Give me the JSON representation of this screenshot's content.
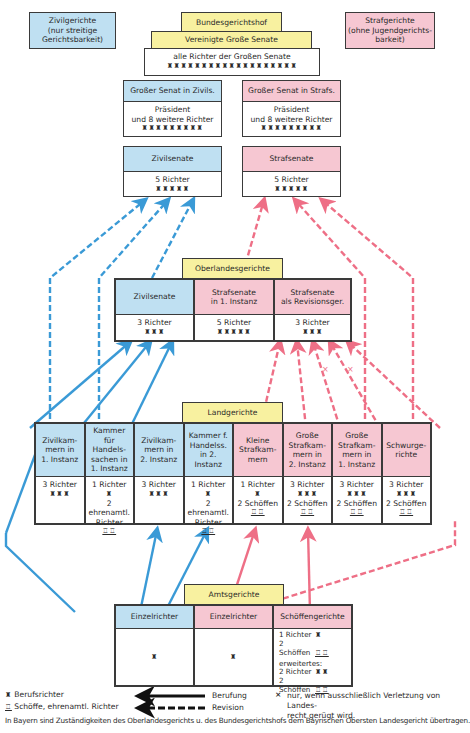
{
  "legend_boxes": {
    "civil": "Zivilgerichte\n(nur streitige\nGerichtsbarkeit)",
    "criminal": "Strafgerichte\n(ohne Jugendgerichts-\nbarkeit)"
  },
  "bgh": {
    "title": "Bundesgerichtshof",
    "united": "Vereinigte Große Senate",
    "all_judges_label": "alle Richter der Großen Senate",
    "all_judges_icons": "♜♜♜♜♜♜♜♜♜♜♜♜♜♜♜♜♜♜♜",
    "grand_civil": {
      "title": "Großer Senat in Zivils.",
      "line1": "Präsident",
      "line2": "und 8 weitere Richter",
      "icons": "♜♜♜♜♜♜♜♜♜"
    },
    "grand_criminal": {
      "title": "Großer Senat in Strafs.",
      "line1": "Präsident",
      "line2": "und 8 weitere Richter",
      "icons": "♜♜♜♜♜♜♜♜♜"
    },
    "civil_senates": {
      "title": "Zivilsenate",
      "judges": "5 Richter",
      "icons": "♜♜♜♜♜"
    },
    "criminal_senates": {
      "title": "Strafsenate",
      "judges": "5 Richter",
      "icons": "♜♜♜♜♜"
    }
  },
  "olg": {
    "title": "Oberlandesgerichte",
    "cells": [
      {
        "title": "Zivilsenate",
        "judges": "3 Richter",
        "icons": "♜♜♜"
      },
      {
        "title": "Strafsenate\nin 1. Instanz",
        "judges": "5 Richter",
        "icons": "♜♜♜♜♜"
      },
      {
        "title": "Strafsenate\nals Revisionsger.",
        "judges": "3 Richter",
        "icons": "♜♜♜"
      }
    ]
  },
  "lg": {
    "title": "Landgerichte",
    "cells": [
      {
        "title": "Zivilkam-\nmern in\n1. Instanz",
        "judges": "3 Richter",
        "icons": "♜♜♜",
        "lay": "",
        "lay_icons": ""
      },
      {
        "title": "Kammer\nfür Handels-\nsachen in\n1. Instanz",
        "judges": "1 Richter",
        "icons": "♜",
        "lay": "2 ehrenamtl.\nRichter",
        "lay_icons": "♖♖"
      },
      {
        "title": "Zivilkam-\nmern in\n2. Instanz",
        "judges": "3 Richter",
        "icons": "♜♜♜",
        "lay": "",
        "lay_icons": ""
      },
      {
        "title": "Kammer f.\nHandelss.\nin 2. Instanz",
        "judges": "1 Richter",
        "icons": "♜",
        "lay": "2 ehrenamtl.\nRichter",
        "lay_icons": "♖♖"
      },
      {
        "title": "Kleine\nStrafkam-\nmern",
        "judges": "1 Richter",
        "icons": "♜",
        "lay": "2 Schöffen",
        "lay_icons": "♖♖"
      },
      {
        "title": "Große\nStrafkam-\nmern in\n2. Instanz",
        "judges": "3 Richter",
        "icons": "♜♜♜",
        "lay": "2 Schöffen",
        "lay_icons": "♖♖"
      },
      {
        "title": "Große\nStrafkam-\nmern in\n1. Instanz",
        "judges": "3 Richter",
        "icons": "♜♜♜",
        "lay": "2 Schöffen",
        "lay_icons": "♖♖"
      },
      {
        "title": "Schwurge-\nrichte",
        "judges": "3 Richter",
        "icons": "♜♜♜",
        "lay": "2 Schöffen",
        "lay_icons": "♖♖"
      }
    ]
  },
  "ag": {
    "title": "Amtsgerichte",
    "cells": [
      {
        "title": "Einzelrichter",
        "icons": "♜"
      },
      {
        "title": "Einzelrichter",
        "icons": "♜"
      },
      {
        "title": "Schöffengerichte",
        "l1": "1 Richter",
        "l1_icons": "♜",
        "l2": "2 Schöffen",
        "l2_icons": "♖♖",
        "ext": "erweitertes:",
        "l3": "2 Richter",
        "l3_icons": "♜♜",
        "l4": "2 Schöffen",
        "l4_icons": "♖♖"
      }
    ]
  },
  "legend": {
    "professional_icon": "♜",
    "professional": "Berufsrichter",
    "lay_icon": "♖",
    "lay": "Schöffe, ehrenamtl. Richter",
    "appeal": "Berufung",
    "revision": "Revision",
    "x_mark": "×",
    "x_note": "nur, wenn ausschließlich Verletzung von Landes-\nrecht gerügt wird."
  },
  "footer": "In Bayern sind Zuständigkeiten des Oberlandesgerichts u. des Bundesgerichtshofs dem Bayrischen Obersten Landesgericht übertragen.",
  "colors": {
    "civil": "#bfe0f2",
    "criminal": "#f6c7d2",
    "court": "#f8f1a0",
    "civil_arrow": "#3a9ad6",
    "criminal_arrow": "#ee6f86"
  }
}
